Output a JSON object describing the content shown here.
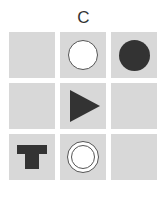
{
  "title": "C",
  "colors": {
    "cell_bg": "#d8d8d8",
    "shape_dark": "#333333",
    "shape_light": "#ffffff"
  },
  "grid": {
    "rows": 3,
    "cols": 3,
    "cells": [
      {
        "row": 0,
        "col": 0,
        "shape": "empty"
      },
      {
        "row": 0,
        "col": 1,
        "shape": "white-circle"
      },
      {
        "row": 0,
        "col": 2,
        "shape": "black-circle"
      },
      {
        "row": 1,
        "col": 0,
        "shape": "empty"
      },
      {
        "row": 1,
        "col": 1,
        "shape": "black-triangle-right"
      },
      {
        "row": 1,
        "col": 2,
        "shape": "empty"
      },
      {
        "row": 2,
        "col": 0,
        "shape": "black-t-shape"
      },
      {
        "row": 2,
        "col": 1,
        "shape": "double-ring-circle"
      },
      {
        "row": 2,
        "col": 2,
        "shape": "empty"
      }
    ]
  }
}
